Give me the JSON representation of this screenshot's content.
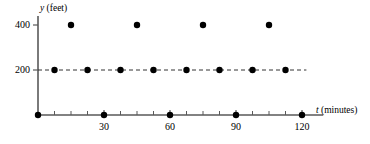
{
  "chart_data": {
    "type": "scatter",
    "title": "",
    "xlabel": "t (minutes)",
    "ylabel": "y (feet)",
    "xlabel_var": "t",
    "xlabel_unit": "(minutes)",
    "ylabel_var": "y",
    "ylabel_unit": "(feet)",
    "xlim": [
      0,
      126
    ],
    "ylim": [
      0,
      440
    ],
    "x_ticks_major": [
      30,
      60,
      90,
      120
    ],
    "x_tick_labels": [
      "30",
      "60",
      "90",
      "120"
    ],
    "x_ticks_minor": [
      7.5,
      15,
      22.5,
      37.5,
      45,
      52.5,
      67.5,
      75,
      82.5,
      97.5,
      105,
      112.5
    ],
    "y_ticks": [
      200,
      400
    ],
    "y_tick_labels": [
      "200",
      "400"
    ],
    "grid": false,
    "reference_line": {
      "y": 200,
      "style": "dashed",
      "x_start": 0,
      "x_end": 122
    },
    "series": [
      {
        "name": "y = 0",
        "marker": "filled-circle",
        "color": "#000000",
        "points": [
          {
            "x": 0,
            "y": 0
          },
          {
            "x": 30,
            "y": 0
          },
          {
            "x": 60,
            "y": 0
          },
          {
            "x": 90,
            "y": 0
          },
          {
            "x": 120,
            "y": 0
          }
        ]
      },
      {
        "name": "y = 200",
        "marker": "filled-circle",
        "color": "#000000",
        "points": [
          {
            "x": 7.5,
            "y": 200
          },
          {
            "x": 22.5,
            "y": 200
          },
          {
            "x": 37.5,
            "y": 200
          },
          {
            "x": 52.5,
            "y": 200
          },
          {
            "x": 67.5,
            "y": 200
          },
          {
            "x": 82.5,
            "y": 200
          },
          {
            "x": 97.5,
            "y": 200
          },
          {
            "x": 112.5,
            "y": 200
          }
        ]
      },
      {
        "name": "y = 400",
        "marker": "filled-circle",
        "color": "#000000",
        "points": [
          {
            "x": 15,
            "y": 400
          },
          {
            "x": 45,
            "y": 400
          },
          {
            "x": 75,
            "y": 400
          },
          {
            "x": 105,
            "y": 400
          }
        ]
      }
    ],
    "axis_color": "#595959",
    "marker_color": "#000000",
    "marker_radius": 3.2
  }
}
